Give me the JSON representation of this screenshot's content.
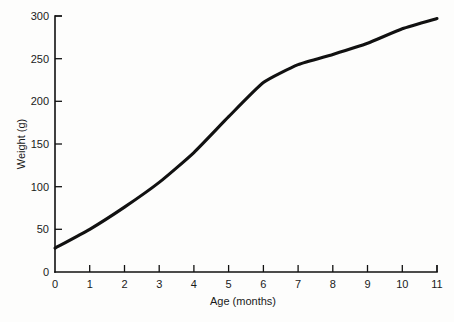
{
  "chart_data": {
    "type": "line",
    "title": "",
    "xlabel": "Age (months)",
    "ylabel": "Weight (g)",
    "x": [
      0,
      1,
      2,
      3,
      4,
      5,
      6,
      7,
      8,
      9,
      10,
      11
    ],
    "values": [
      28,
      50,
      76,
      105,
      140,
      182,
      222,
      243,
      255,
      268,
      285,
      297
    ],
    "series": [
      {
        "name": "Weight",
        "values": [
          28,
          50,
          76,
          105,
          140,
          182,
          222,
          243,
          255,
          268,
          285,
          297
        ]
      }
    ],
    "xlim": [
      0,
      11
    ],
    "ylim": [
      0,
      300
    ],
    "xticks": [
      0,
      1,
      2,
      3,
      4,
      5,
      6,
      7,
      8,
      9,
      10,
      11
    ],
    "yticks": [
      0,
      50,
      100,
      150,
      200,
      250,
      300
    ],
    "xtick_labels": [
      "0",
      "1",
      "2",
      "3",
      "4",
      "5",
      "6",
      "7",
      "8",
      "9",
      "10",
      "11"
    ],
    "ytick_labels": [
      "0",
      "50",
      "100",
      "150",
      "200",
      "250",
      "300"
    ],
    "grid": false,
    "legend": false,
    "legend_position": "none",
    "line_color": "#111111",
    "background_color": "#fdfdfc"
  },
  "axes": {
    "x_title": "Age (months)",
    "y_title": "Weight (g)"
  }
}
